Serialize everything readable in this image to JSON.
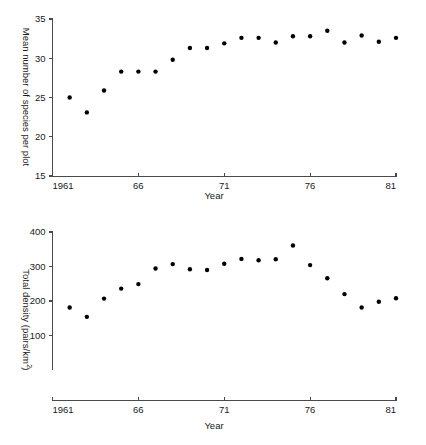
{
  "figure": {
    "name": "two-panel-scatter-figure",
    "marker_color": "#000000",
    "axis_color": "#4a4a4a"
  },
  "chart_data": [
    {
      "id": "species",
      "type": "scatter",
      "title": "",
      "xlabel": "Year",
      "ylabel": "Mean number of species per plot",
      "ylabel_prefix": "Mean number of species per plot",
      "ylabel_suffix": "",
      "xlim": [
        1961,
        1981
      ],
      "ylim": [
        15,
        35
      ],
      "xticks": [
        1961,
        1966,
        1971,
        1976,
        1981
      ],
      "xticklabels": [
        "1961",
        "66",
        "71",
        "76",
        "81"
      ],
      "yticks": [
        15,
        20,
        25,
        30,
        35
      ],
      "yticklabels": [
        "15",
        "20",
        "25",
        "30",
        "35"
      ],
      "grid": false,
      "legend": "none",
      "x": [
        1962,
        1963,
        1964,
        1965,
        1966,
        1967,
        1968,
        1969,
        1970,
        1971,
        1972,
        1973,
        1974,
        1975,
        1976,
        1977,
        1978,
        1979,
        1980,
        1981
      ],
      "values": [
        25.0,
        23.1,
        25.9,
        28.3,
        28.3,
        28.3,
        29.8,
        31.3,
        31.3,
        31.9,
        32.6,
        32.6,
        32.0,
        32.8,
        32.8,
        33.5,
        32.0,
        32.9,
        32.1,
        32.6
      ]
    },
    {
      "id": "density",
      "type": "scatter",
      "title": "",
      "xlabel": "Year",
      "ylabel_prefix": "Total density (pairs/km",
      "ylabel_sup": "2",
      "ylabel_suffix": ")",
      "ylabel": "Total density (pairs/km2)",
      "xlim": [
        1961,
        1981
      ],
      "ylim": [
        0,
        400
      ],
      "xticks": [
        1961,
        1966,
        1971,
        1976,
        1981
      ],
      "xticklabels": [
        "1961",
        "66",
        "71",
        "76",
        "81"
      ],
      "yticks": [
        100,
        200,
        300,
        400
      ],
      "yticklabels": [
        "100",
        "200",
        "300",
        "400"
      ],
      "grid": false,
      "legend": "none",
      "x": [
        1962,
        1963,
        1964,
        1965,
        1966,
        1967,
        1968,
        1969,
        1970,
        1971,
        1972,
        1973,
        1974,
        1975,
        1976,
        1977,
        1978,
        1979,
        1980,
        1981
      ],
      "values": [
        181,
        154,
        207,
        236,
        249,
        294,
        307,
        292,
        290,
        308,
        322,
        318,
        321,
        361,
        304,
        266,
        220,
        181,
        198,
        208
      ]
    }
  ]
}
